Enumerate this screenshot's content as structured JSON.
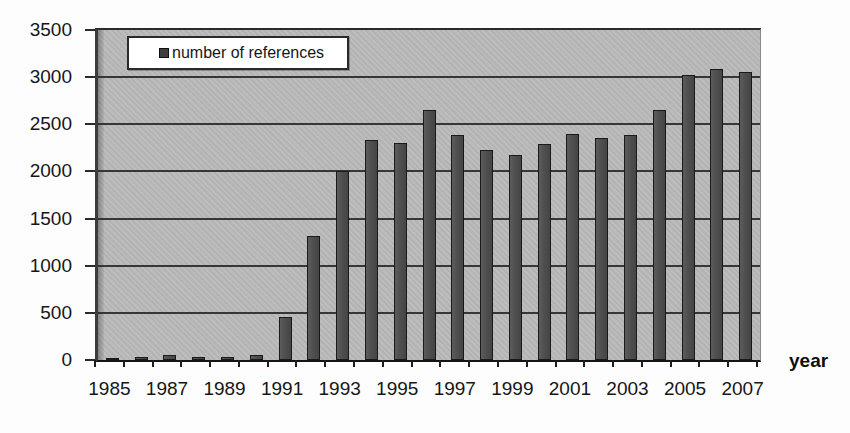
{
  "chart_data": {
    "type": "bar",
    "title": "",
    "xlabel": "year",
    "ylabel": "",
    "legend": [
      "number of references"
    ],
    "legend_position": "top-left",
    "x": [
      1985,
      1986,
      1987,
      1988,
      1989,
      1990,
      1991,
      1992,
      1993,
      1994,
      1995,
      1996,
      1997,
      1998,
      1999,
      2000,
      2001,
      2002,
      2003,
      2004,
      2005,
      2006,
      2007
    ],
    "values": [
      20,
      30,
      50,
      35,
      30,
      55,
      460,
      1320,
      2000,
      2330,
      2300,
      2650,
      2390,
      2230,
      2170,
      2290,
      2400,
      2360,
      2390,
      2650,
      3020,
      3090,
      3060
    ],
    "ylim": [
      0,
      3500
    ],
    "ytick_step": 500,
    "ytick_labels": [
      "0",
      "500",
      "1000",
      "1500",
      "2000",
      "2500",
      "3000",
      "3500"
    ],
    "xtick_labels": [
      "1985",
      "1987",
      "1989",
      "1991",
      "1993",
      "1995",
      "1997",
      "1999",
      "2001",
      "2003",
      "2005",
      "2007"
    ],
    "grid": true
  },
  "colors": {
    "page_bg": "#fdfdfd",
    "plot_bg": "#b9b9b9",
    "gridline": "#2b2b2b",
    "bar": "#4f4f4f",
    "bar_border": "#1a1a1a",
    "text": "#161616",
    "legend_bg": "#ffffff",
    "legend_border": "#2a2a2a"
  }
}
